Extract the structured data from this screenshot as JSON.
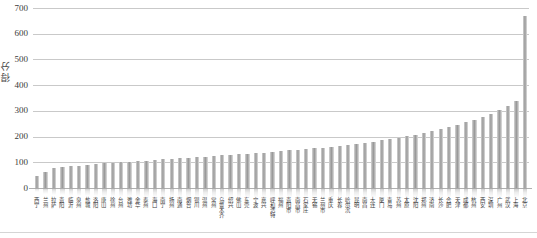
{
  "chart_data": {
    "type": "bar",
    "title": "",
    "xlabel": "",
    "ylabel": "得分",
    "ylim": [
      0,
      700
    ],
    "yticks": [
      0,
      100,
      200,
      300,
      400,
      500,
      600,
      700
    ],
    "grid": true,
    "legend": "none",
    "orientation": "vertical",
    "sorted": "ascending",
    "bar_color": "#9a9a9a",
    "categories": [
      "西宁",
      "兰州",
      "拉萨",
      "贵阳",
      "临沂",
      "泉州",
      "盐城",
      "洛阳",
      "唐山",
      "徐州",
      "台州",
      "潍坊",
      "金华",
      "泰州",
      "海口",
      "南宁",
      "扬州",
      "南通",
      "烟台",
      "银川",
      "温州",
      "常州",
      "乌鲁木齐",
      "绍兴",
      "佛山",
      "东莞",
      "宁波",
      "嘉兴",
      "呼和浩特",
      "福州",
      "贵阳市",
      "南昌市",
      "石家庄",
      "无锡",
      "兰州市",
      "重庆",
      "长春",
      "哈尔滨",
      "昆明",
      "南昌",
      "大连",
      "厦门",
      "青岛",
      "苏州",
      "太原",
      "沈阳",
      "郑州",
      "济南",
      "长沙",
      "合肥",
      "天津",
      "成都",
      "杭州",
      "西安",
      "深圳",
      "广州",
      "武汉",
      "上海",
      "北京"
    ],
    "values": [
      45,
      62,
      78,
      82,
      84,
      86,
      88,
      92,
      96,
      99,
      101,
      103,
      105,
      107,
      109,
      111,
      113,
      116,
      118,
      120,
      122,
      124,
      127,
      129,
      131,
      133,
      136,
      138,
      141,
      143,
      146,
      148,
      151,
      154,
      157,
      160,
      163,
      167,
      171,
      175,
      180,
      185,
      190,
      196,
      202,
      208,
      215,
      222,
      230,
      238,
      247,
      256,
      266,
      277,
      289,
      302,
      318,
      340,
      670
    ]
  }
}
